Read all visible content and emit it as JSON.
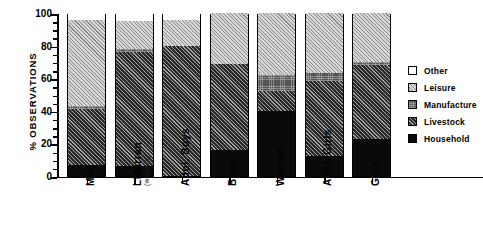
{
  "chart_data": {
    "type": "bar",
    "subtype": "stacked-bar-100",
    "title": "",
    "xlabel": "",
    "ylabel": "% OBSERVATIONS",
    "ylim": [
      0,
      100
    ],
    "yticks": [
      0,
      20,
      40,
      60,
      80,
      100
    ],
    "ytick_labels": [
      "0",
      "20",
      "40",
      "60",
      "80",
      "100"
    ],
    "minor_tick_step": 5,
    "grid": false,
    "legend_position": "right",
    "categories": [
      "Men",
      "LMurran",
      "Adol. Boys",
      "Boys",
      "Women",
      "Adol. Girls",
      "Girls"
    ],
    "category_sublabels": [
      "",
      "(warriors)",
      "",
      "",
      "",
      "",
      ""
    ],
    "series": [
      {
        "name": "Household",
        "fill": "solid-black",
        "color": "#0a0a0a",
        "values": [
          7,
          6,
          0,
          16,
          40,
          12,
          23
        ]
      },
      {
        "name": "Livestock",
        "fill": "dark-diagonal-hatch",
        "color": "#2a2a2a",
        "values": [
          34,
          70,
          80,
          53,
          12,
          46,
          45
        ]
      },
      {
        "name": "Manufacture",
        "fill": "medium-gray-dotted",
        "color": "#555555",
        "values": [
          2,
          2,
          0,
          0,
          10,
          5,
          2
        ]
      },
      {
        "name": "Leisure",
        "fill": "light-diagonal-hatch",
        "color": "#d7d7d7",
        "values": [
          53,
          17,
          16,
          31,
          38,
          37,
          30
        ]
      },
      {
        "name": "Other",
        "fill": "white",
        "color": "#ffffff",
        "values": [
          4,
          5,
          4,
          0,
          0,
          0,
          0
        ]
      }
    ],
    "cumulative_tops": {
      "Men": [
        7,
        41,
        43,
        96,
        100
      ],
      "LMurran": [
        6,
        76,
        78,
        95,
        100
      ],
      "Adol. Boys": [
        0,
        80,
        80,
        96,
        100
      ],
      "Boys": [
        16,
        69,
        69,
        100,
        100
      ],
      "Women": [
        40,
        52,
        62,
        100,
        100
      ],
      "Adol. Girls": [
        12,
        58,
        63,
        100,
        100
      ],
      "Girls": [
        23,
        68,
        70,
        100,
        100
      ]
    },
    "legend": [
      {
        "label": "Other",
        "fill": "white"
      },
      {
        "label": "Leisure",
        "fill": "light-diagonal-hatch"
      },
      {
        "label": "Manufacture",
        "fill": "medium-gray-dotted"
      },
      {
        "label": "Livestock",
        "fill": "dark-diagonal-hatch"
      },
      {
        "label": "Household",
        "fill": "solid-black"
      }
    ]
  }
}
